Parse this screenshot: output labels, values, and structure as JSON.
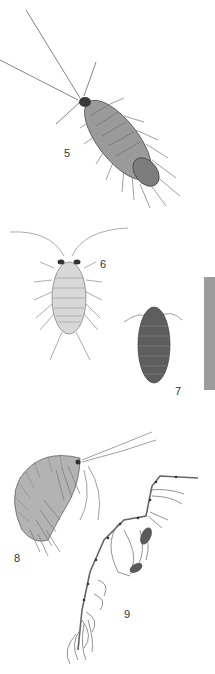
{
  "plate": {
    "figures": [
      {
        "number": "5",
        "label_x": 64,
        "label_y": 147,
        "description": "sea slater (Ligia), dorsal view, long antennae"
      },
      {
        "number": "6",
        "label_x": 100,
        "label_y": 258,
        "description": "pale aquatic isopod, dorsal view"
      },
      {
        "number": "7",
        "label_x": 175,
        "label_y": 385,
        "description": "dark woodlouse, dorsal view"
      },
      {
        "number": "8",
        "label_x": 14,
        "label_y": 552,
        "description": "amphipod (sandhopper), lateral view"
      },
      {
        "number": "9",
        "label_x": 124,
        "label_y": 608,
        "description": "skeleton shrimp (Caprella)"
      }
    ],
    "colors": {
      "background": "#ffffff",
      "tab": "#9c9c9c",
      "ink": "#555555"
    }
  }
}
